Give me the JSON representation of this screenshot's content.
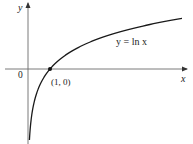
{
  "chart_data": {
    "type": "line",
    "title": "",
    "function": "y = ln x",
    "xlabel": "x",
    "ylabel": "y",
    "origin_label": "0",
    "curve_label": "y = ln x",
    "annotations": [
      {
        "point": [
          1,
          0
        ],
        "label": "(1, 0)",
        "marker": "dot"
      }
    ],
    "xlim": [
      -1.05,
      7.2
    ],
    "ylim": [
      -2.9,
      2.55
    ],
    "grid": false,
    "legend": "none",
    "series": [
      {
        "name": "y = ln x",
        "x": [
          0.065,
          0.1,
          0.2,
          0.3,
          0.5,
          0.75,
          1,
          1.5,
          2,
          3,
          4,
          5,
          6,
          7
        ],
        "values": [
          -2.73,
          -2.3,
          -1.61,
          -1.2,
          -0.69,
          -0.29,
          0,
          0.41,
          0.69,
          1.1,
          1.39,
          1.61,
          1.79,
          1.95
        ]
      }
    ]
  },
  "labels": {
    "y_axis": "y",
    "x_axis": "x",
    "origin": "0",
    "point": "(1, 0)",
    "curve": "y = ln x"
  },
  "colors": {
    "axis": "#6b6b6b",
    "curve": "#1a1a1a",
    "text": "#222222"
  }
}
